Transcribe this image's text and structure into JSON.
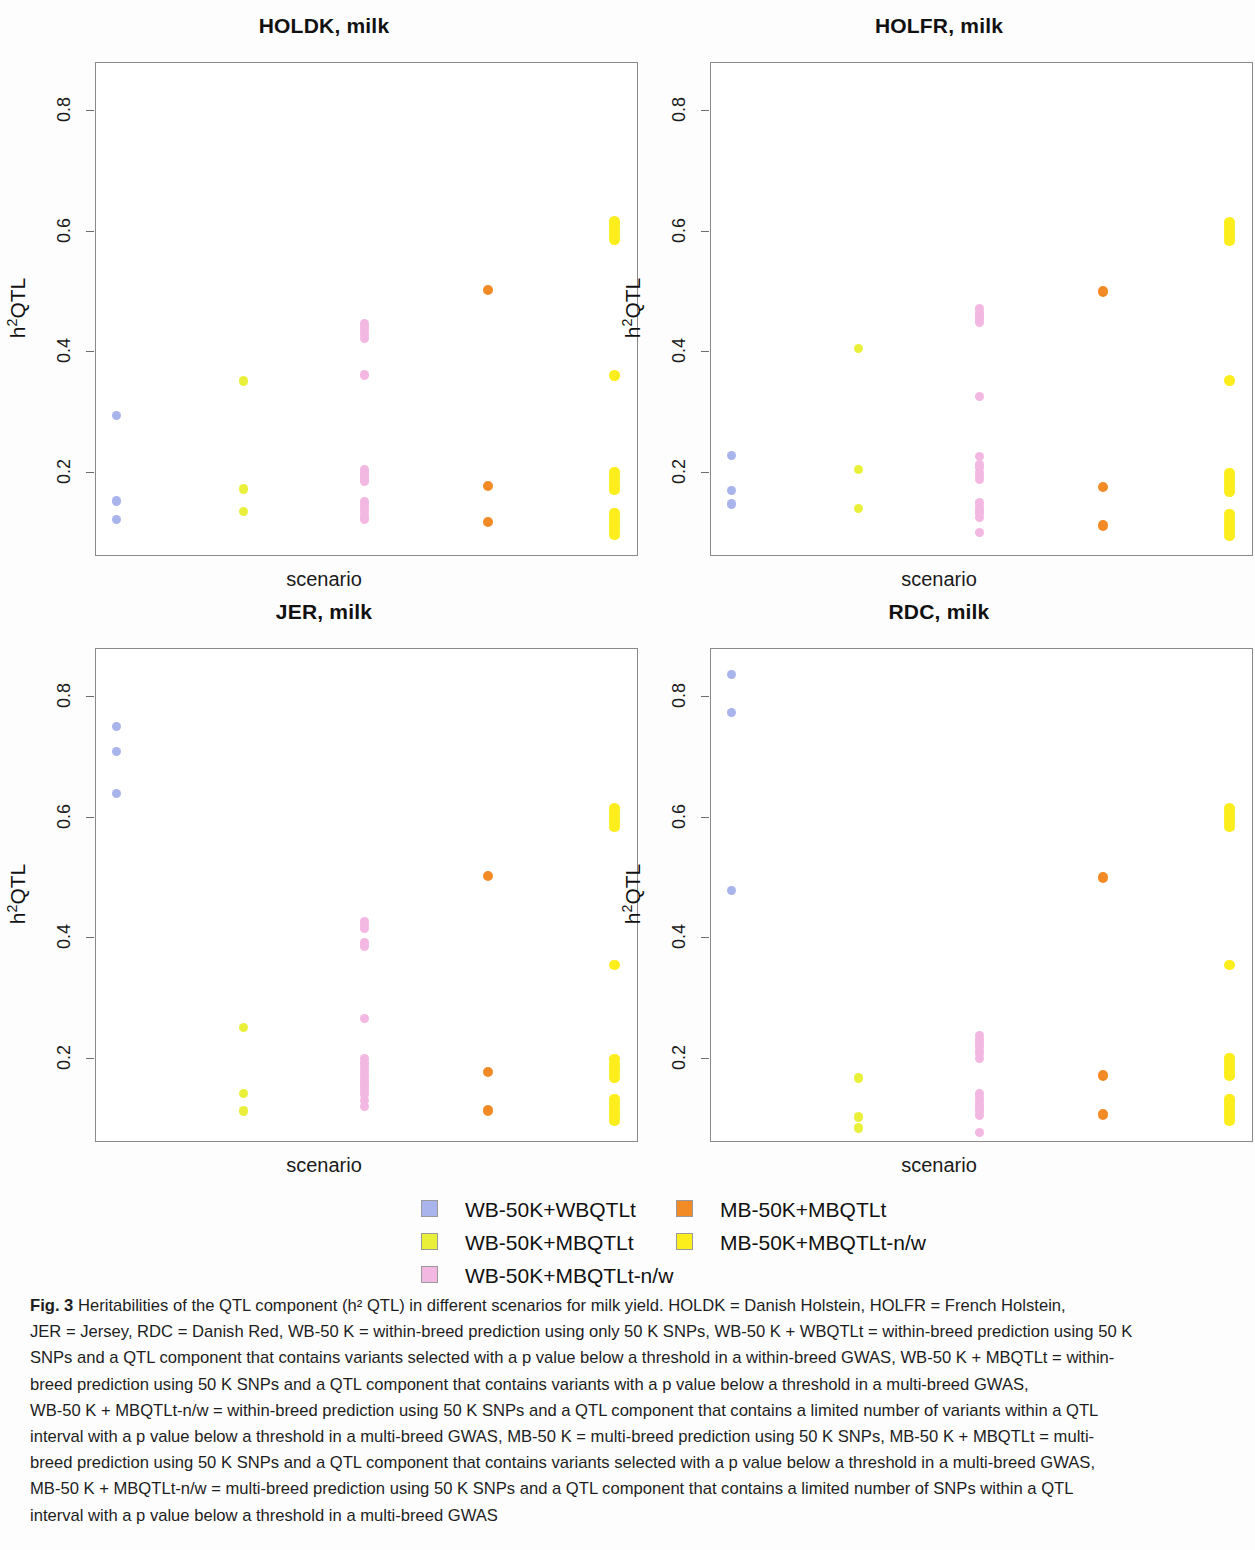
{
  "figure": {
    "label": "Fig. 3",
    "legend": {
      "columns": [
        [
          {
            "label": "WB-50K+WBQTLt",
            "color": "#aab4ec"
          },
          {
            "label": "WB-50K+MBQTLt",
            "color": "#eaf03a"
          },
          {
            "label": "WB-50K+MBQTLt-n/w",
            "color": "#f3b8e2"
          }
        ],
        [
          {
            "label": "MB-50K+MBQTLt",
            "color": "#f28b26"
          },
          {
            "label": "MB-50K+MBQTLt-n/w",
            "color": "#fbee1c"
          }
        ]
      ]
    },
    "caption_lines": [
      "Heritabilities of the QTL component (h² QTL) in different scenarios for milk yield. HOLDK = Danish Holstein, HOLFR = French Holstein,",
      "JER = Jersey, RDC = Danish Red, WB-50 K = within-breed prediction using only 50 K SNPs, WB-50 K + WBQTLt = within-breed prediction using 50 K",
      "SNPs and a QTL component that contains variants selected with a p value below a threshold in a within-breed GWAS, WB-50 K + MBQTLt = within-",
      "breed prediction using 50 K SNPs and a QTL component that contains variants with a p value below a threshold in a multi-breed GWAS,",
      "WB-50 K + MBQTLt-n/w = within-breed prediction using 50 K SNPs and a QTL component that contains a limited number of variants within a QTL",
      "interval with a p value below a threshold in a multi-breed GWAS, MB-50 K = multi-breed prediction using 50 K SNPs, MB-50 K + MBQTLt = multi-",
      "breed prediction using 50 K SNPs and a QTL component that contains variants selected with a p value below a threshold in a multi-breed GWAS,",
      "MB-50 K + MBQTLt-n/w = multi-breed prediction using 50 K SNPs and a QTL component that contains a limited number of SNPs within a QTL",
      "interval with a p value below a threshold in a multi-breed GWAS"
    ]
  },
  "chart_data": {
    "type": "scatter",
    "ylabel": "h²QTL",
    "xlabel": "scenario",
    "ylim": [
      0.06,
      0.88
    ],
    "yticks": [
      0.2,
      0.4,
      0.6,
      0.8
    ],
    "ytick_labels": [
      "0.2",
      "0.4",
      "0.6",
      "0.8"
    ],
    "grid": false,
    "legend_position": "bottom",
    "series_names": [
      "WB-50K+WBQTLt",
      "WB-50K+MBQTLt",
      "WB-50K+MBQTLt-n/w",
      "MB-50K+MBQTLt",
      "MB-50K+MBQTLt-n/w"
    ],
    "series_colors": [
      "#aab4ec",
      "#eaf03a",
      "#f3b8e2",
      "#f28b26",
      "#fbee1c"
    ],
    "panels": [
      {
        "title": "HOLDK, milk",
        "series": [
          {
            "name": "WB-50K+WBQTLt",
            "color": "#aab4ec",
            "values": [
              0.295,
              0.153,
              0.122
            ]
          },
          {
            "name": "WB-50K+MBQTLt",
            "color": "#eaf03a",
            "values": [
              0.352,
              0.173,
              0.135
            ]
          },
          {
            "name": "WB-50K+MBQTLt-n/w",
            "color": "#f3b8e2",
            "values": [
              0.448,
              0.443,
              0.437,
              0.43,
              0.423,
              0.362,
              0.205,
              0.2,
              0.196,
              0.191,
              0.186,
              0.152,
              0.147,
              0.141,
              0.135,
              0.129,
              0.123
            ]
          },
          {
            "name": "MB-50K+MBQTLt",
            "color": "#f28b26",
            "values": [
              0.503,
              0.178,
              0.118
            ]
          },
          {
            "name": "MB-50K+MBQTLt-n/w",
            "color": "#fbee1c",
            "values": [
              0.617,
              0.611,
              0.605,
              0.599,
              0.593,
              0.587,
              0.361,
              0.201,
              0.195,
              0.189,
              0.183,
              0.177,
              0.171,
              0.133,
              0.127,
              0.121,
              0.115,
              0.109,
              0.103,
              0.097
            ]
          }
        ]
      },
      {
        "title": "HOLFR, milk",
        "series": [
          {
            "name": "WB-50K+WBQTLt",
            "color": "#aab4ec",
            "values": [
              0.228,
              0.17,
              0.148
            ]
          },
          {
            "name": "WB-50K+MBQTLt",
            "color": "#eaf03a",
            "values": [
              0.406,
              0.205,
              0.14
            ]
          },
          {
            "name": "WB-50K+MBQTLt-n/w",
            "color": "#f3b8e2",
            "values": [
              0.472,
              0.466,
              0.46,
              0.455,
              0.449,
              0.327,
              0.227,
              0.214,
              0.208,
              0.2,
              0.194,
              0.188,
              0.15,
              0.144,
              0.138,
              0.132,
              0.126,
              0.101
            ]
          },
          {
            "name": "MB-50K+MBQTLt",
            "color": "#f28b26",
            "values": [
              0.501,
              0.176,
              0.112
            ]
          },
          {
            "name": "MB-50K+MBQTLt-n/w",
            "color": "#fbee1c",
            "values": [
              0.615,
              0.609,
              0.603,
              0.597,
              0.591,
              0.585,
              0.353,
              0.199,
              0.193,
              0.187,
              0.181,
              0.175,
              0.169,
              0.131,
              0.125,
              0.119,
              0.113,
              0.107,
              0.101,
              0.095
            ]
          }
        ]
      },
      {
        "title": "JER, milk",
        "series": [
          {
            "name": "WB-50K+WBQTLt",
            "color": "#aab4ec",
            "values": [
              0.752,
              0.71,
              0.64
            ]
          },
          {
            "name": "WB-50K+MBQTLt",
            "color": "#eaf03a",
            "values": [
              0.252,
              0.142,
              0.113
            ]
          },
          {
            "name": "WB-50K+MBQTLt-n/w",
            "color": "#f3b8e2",
            "values": [
              0.428,
              0.422,
              0.416,
              0.393,
              0.387,
              0.266,
              0.2,
              0.194,
              0.188,
              0.182,
              0.176,
              0.17,
              0.164,
              0.158,
              0.152,
              0.146,
              0.14,
              0.13,
              0.12
            ]
          },
          {
            "name": "MB-50K+MBQTLt",
            "color": "#f28b26",
            "values": [
              0.503,
              0.178,
              0.114
            ]
          },
          {
            "name": "MB-50K+MBQTLt-n/w",
            "color": "#fbee1c",
            "values": [
              0.615,
              0.609,
              0.603,
              0.597,
              0.591,
              0.585,
              0.355,
              0.199,
              0.193,
              0.187,
              0.181,
              0.175,
              0.169,
              0.133,
              0.127,
              0.121,
              0.115,
              0.109,
              0.103,
              0.097
            ]
          }
        ]
      },
      {
        "title": "RDC, milk",
        "series": [
          {
            "name": "WB-50K+WBQTLt",
            "color": "#aab4ec",
            "values": [
              0.838,
              0.775,
              0.479
            ]
          },
          {
            "name": "WB-50K+MBQTLt",
            "color": "#eaf03a",
            "values": [
              0.168,
              0.103,
              0.085
            ]
          },
          {
            "name": "WB-50K+MBQTLt-n/w",
            "color": "#f3b8e2",
            "values": [
              0.238,
              0.232,
              0.226,
              0.22,
              0.214,
              0.208,
              0.2,
              0.142,
              0.136,
              0.13,
              0.124,
              0.118,
              0.112,
              0.106,
              0.078
            ]
          },
          {
            "name": "MB-50K+MBQTLt",
            "color": "#f28b26",
            "values": [
              0.501,
              0.172,
              0.107
            ]
          },
          {
            "name": "MB-50K+MBQTLt-n/w",
            "color": "#fbee1c",
            "values": [
              0.615,
              0.609,
              0.603,
              0.597,
              0.591,
              0.585,
              0.355,
              0.201,
              0.195,
              0.189,
              0.183,
              0.177,
              0.171,
              0.133,
              0.127,
              0.121,
              0.115,
              0.109,
              0.103,
              0.097
            ]
          }
        ]
      }
    ]
  }
}
